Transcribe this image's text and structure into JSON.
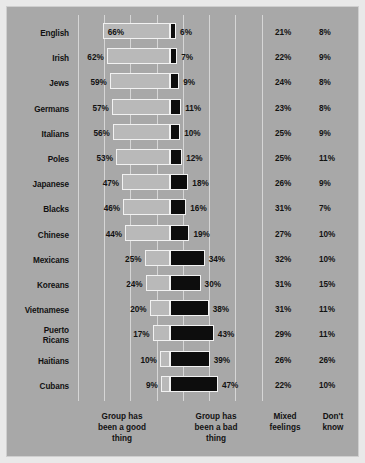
{
  "chart_data": {
    "type": "bar",
    "subtype": "diverging-stacked-bar",
    "title": "",
    "xlabel": "",
    "ylabel": "",
    "grid": true,
    "legend_position": "bottom",
    "axis_note": "Percent; 'good thing' bars extend left from zero line, 'bad thing' bars extend right",
    "categories": [
      "English",
      "Irish",
      "Jews",
      "Germans",
      "Italians",
      "Poles",
      "Japanese",
      "Blacks",
      "Chinese",
      "Mexicans",
      "Koreans",
      "Vietnamese",
      "Puerto Ricans",
      "Haitians",
      "Cubans"
    ],
    "series": [
      {
        "name": "Group has been a good thing",
        "key": "good",
        "color": "#b9b9b9",
        "values": [
          66,
          62,
          59,
          57,
          56,
          53,
          47,
          46,
          44,
          25,
          24,
          20,
          17,
          10,
          9
        ]
      },
      {
        "name": "Group has been a bad thing",
        "key": "bad",
        "color": "#0d0d0d",
        "values": [
          6,
          7,
          9,
          11,
          10,
          12,
          18,
          16,
          19,
          34,
          30,
          38,
          43,
          39,
          47
        ]
      },
      {
        "name": "Mixed feelings",
        "key": "mixed",
        "color": "#a8a8a8",
        "values": [
          21,
          22,
          24,
          23,
          25,
          25,
          26,
          31,
          27,
          32,
          31,
          31,
          29,
          26,
          22
        ]
      },
      {
        "name": "Don't know",
        "key": "dontknow",
        "color": "#a8a8a8",
        "values": [
          8,
          9,
          8,
          8,
          9,
          11,
          9,
          7,
          10,
          10,
          15,
          11,
          11,
          26,
          10
        ]
      }
    ],
    "rows": [
      {
        "label": "English",
        "label_lines": [
          "English"
        ],
        "good": "66%",
        "bad": "6%",
        "mixed": "21%",
        "dontknow": "8%",
        "good_val": 66,
        "bad_val": 6,
        "good_label_inside": true
      },
      {
        "label": "Irish",
        "label_lines": [
          "Irish"
        ],
        "good": "62%",
        "bad": "7%",
        "mixed": "22%",
        "dontknow": "9%",
        "good_val": 62,
        "bad_val": 7,
        "good_label_inside": false
      },
      {
        "label": "Jews",
        "label_lines": [
          "Jews"
        ],
        "good": "59%",
        "bad": "9%",
        "mixed": "24%",
        "dontknow": "8%",
        "good_val": 59,
        "bad_val": 9,
        "good_label_inside": false
      },
      {
        "label": "Germans",
        "label_lines": [
          "Germans"
        ],
        "good": "57%",
        "bad": "11%",
        "mixed": "23%",
        "dontknow": "8%",
        "good_val": 57,
        "bad_val": 11,
        "good_label_inside": false
      },
      {
        "label": "Italians",
        "label_lines": [
          "Italians"
        ],
        "good": "56%",
        "bad": "10%",
        "mixed": "25%",
        "dontknow": "9%",
        "good_val": 56,
        "bad_val": 10,
        "good_label_inside": false
      },
      {
        "label": "Poles",
        "label_lines": [
          "Poles"
        ],
        "good": "53%",
        "bad": "12%",
        "mixed": "25%",
        "dontknow": "11%",
        "good_val": 53,
        "bad_val": 12,
        "good_label_inside": false
      },
      {
        "label": "Japanese",
        "label_lines": [
          "Japanese"
        ],
        "good": "47%",
        "bad": "18%",
        "mixed": "26%",
        "dontknow": "9%",
        "good_val": 47,
        "bad_val": 18,
        "good_label_inside": false
      },
      {
        "label": "Blacks",
        "label_lines": [
          "Blacks"
        ],
        "good": "46%",
        "bad": "16%",
        "mixed": "31%",
        "dontknow": "7%",
        "good_val": 46,
        "bad_val": 16,
        "good_label_inside": false
      },
      {
        "label": "Chinese",
        "label_lines": [
          "Chinese"
        ],
        "good": "44%",
        "bad": "19%",
        "mixed": "27%",
        "dontknow": "10%",
        "good_val": 44,
        "bad_val": 19,
        "good_label_inside": false
      },
      {
        "label": "Mexicans",
        "label_lines": [
          "Mexicans"
        ],
        "good": "25%",
        "bad": "34%",
        "mixed": "32%",
        "dontknow": "10%",
        "good_val": 25,
        "bad_val": 34,
        "good_label_inside": false
      },
      {
        "label": "Koreans",
        "label_lines": [
          "Koreans"
        ],
        "good": "24%",
        "bad": "30%",
        "mixed": "31%",
        "dontknow": "15%",
        "good_val": 24,
        "bad_val": 30,
        "good_label_inside": false
      },
      {
        "label": "Vietnamese",
        "label_lines": [
          "Vietnamese"
        ],
        "good": "20%",
        "bad": "38%",
        "mixed": "31%",
        "dontknow": "11%",
        "good_val": 20,
        "bad_val": 38,
        "good_label_inside": false
      },
      {
        "label": "Puerto Ricans",
        "label_lines": [
          "Puerto",
          "Ricans"
        ],
        "good": "17%",
        "bad": "43%",
        "mixed": "29%",
        "dontknow": "11%",
        "good_val": 17,
        "bad_val": 43,
        "good_label_inside": false
      },
      {
        "label": "Haitians",
        "label_lines": [
          "Haitians"
        ],
        "good": "10%",
        "bad": "39%",
        "mixed": "26%",
        "dontknow": "26%",
        "good_val": 10,
        "bad_val": 39,
        "good_label_inside": false
      },
      {
        "label": "Cubans",
        "label_lines": [
          "Cubans"
        ],
        "good": "9%",
        "bad": "47%",
        "mixed": "22%",
        "dontknow": "10%",
        "good_val": 9,
        "bad_val": 47,
        "good_label_inside": false
      }
    ],
    "footer": {
      "good": "Group has\nbeen a good\nthing",
      "bad": "Group has\nbeen a bad\nthing",
      "mixed": "Mixed\nfeelings",
      "dontknow": "Don't\nknow"
    },
    "gridlines_px": [
      71,
      97,
      123,
      150,
      176,
      202,
      228,
      255
    ],
    "zero_line_px": 163,
    "px_per_percent": 1.02
  }
}
